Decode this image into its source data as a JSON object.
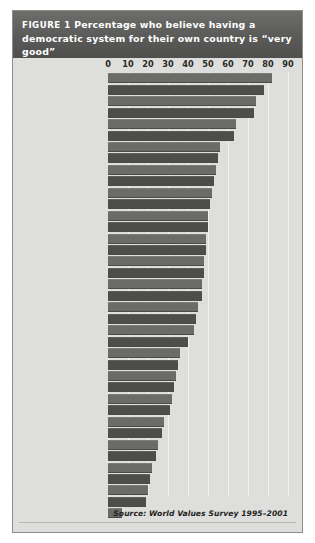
{
  "figure": {
    "label": "FIGURE 1",
    "title": "Percentage who believe having a democratic system for their own country is “very good”",
    "source": "Source: World Values Survey 1995–2001",
    "colors": {
      "band_bg": "#5a5a58",
      "plot_bg": "#dededc",
      "bar_light": "#6b6b69",
      "bar_dark": "#4d4d4b",
      "gridline": "#f2f2f0",
      "title_text": "#ffffff"
    }
  },
  "chart_data": {
    "type": "bar",
    "orientation": "horizontal",
    "title": "FIGURE 1 Percentage who believe having a democratic system for their own country is “very good”",
    "xlabel": "",
    "ylabel": "",
    "xlim": [
      0,
      90
    ],
    "xticks": [
      0,
      10,
      20,
      30,
      40,
      50,
      60,
      70,
      80,
      90
    ],
    "tick_labels": [
      "0",
      "10",
      "20",
      "30",
      "40",
      "50",
      "60",
      "70",
      "80",
      "90"
    ],
    "grid": true,
    "legend": false,
    "annotations": [
      "Source: World Values Survey 1995–2001"
    ],
    "categories": [
      "MOROCCO",
      "GREECE",
      "ALBANIA",
      "DENMARK",
      "NORWAY",
      "EGYPT",
      "BOSNIA",
      "ALGERIA",
      "GERMANY",
      "PAKISTAN",
      "UNITED STATES",
      "JORDAN",
      "IRAN",
      "CANADA",
      "FRANCE",
      "AUSTRALIA",
      "IRELAND",
      "SPAIN",
      "YUGOSLAVIA",
      "SOUTH AFRICA",
      "INDIA",
      "TURKEY",
      "BRITAIN",
      "JAPAN",
      "SLOVAKIA",
      "FINLAND",
      "COLOMBIA",
      "CHILE",
      "MEXICO",
      "BRAZIL",
      "LITHUANIA",
      "EL SALVADOR",
      "BELARUS",
      "TAIWAN",
      "POLAND",
      "CHINA",
      "LATVIA",
      "UKRAINE",
      "RUSSIA"
    ],
    "values": [
      82,
      78,
      74,
      73,
      64,
      63,
      56,
      55,
      54,
      53,
      52,
      51,
      50,
      50,
      49,
      49,
      48,
      48,
      47,
      47,
      45,
      44,
      43,
      40,
      36,
      35,
      34,
      33,
      32,
      31,
      28,
      27,
      25,
      24,
      22,
      21,
      20,
      19,
      7
    ]
  }
}
